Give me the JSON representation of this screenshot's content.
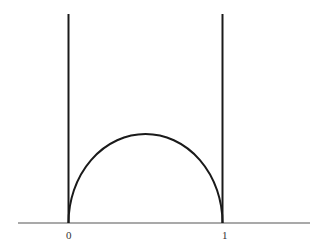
{
  "diagram": {
    "axis_labels": {
      "left": "0",
      "right": "1"
    },
    "colors": {
      "stroke": "#1a1a1a",
      "axis": "#555555",
      "background": "#ffffff"
    }
  }
}
